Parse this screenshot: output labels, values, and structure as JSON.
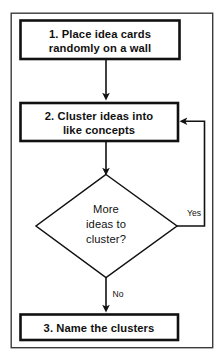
{
  "diagram": {
    "frame": {
      "stroke": "#3a3a3a",
      "fill": "#ffffff"
    },
    "colors": {
      "shape_stroke": "#111111",
      "connector_stroke": "#1a1a1a",
      "shape_fill": "#ffffff",
      "text": "#111111",
      "page_background": "#ffffff"
    },
    "steps": [
      {
        "id": "step-1",
        "shape": "process",
        "number": "1.",
        "lines": [
          "1.  Place idea cards",
          "randomly on a wall"
        ]
      },
      {
        "id": "step-2",
        "shape": "process",
        "number": "2.",
        "lines": [
          "2.  Cluster ideas into",
          "like concepts"
        ]
      },
      {
        "id": "decision-1",
        "shape": "decision",
        "lines": [
          "More",
          "ideas to",
          "cluster?"
        ]
      },
      {
        "id": "step-3",
        "shape": "process",
        "number": "3.",
        "lines": [
          "3.  Name the clusters"
        ]
      }
    ],
    "edge_labels": {
      "yes": "Yes",
      "no": "No"
    }
  }
}
